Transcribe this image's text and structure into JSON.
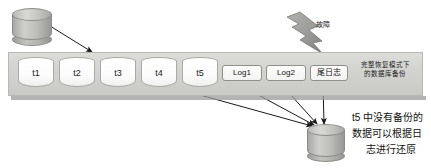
{
  "diagram": {
    "source_db": {
      "name": "source-database"
    },
    "timeline": {
      "checkpoints": [
        {
          "label": "t1"
        },
        {
          "label": "t2"
        },
        {
          "label": "t3"
        },
        {
          "label": "t4"
        },
        {
          "label": "t5"
        }
      ],
      "logs": [
        {
          "label": "Log1"
        },
        {
          "label": "Log2"
        },
        {
          "label": "尾日志"
        }
      ],
      "caption_line1": "完整恢复模式下",
      "caption_line2": "的数据库备份"
    },
    "fault": {
      "label": "故障"
    },
    "restore_db": {
      "name": "restored-database"
    },
    "restore_note": {
      "line1": "t5 中没有备份的",
      "line2": "数据可以根据日",
      "line3": "志进行还原"
    },
    "colors": {
      "bar_fill": "#d2d2ce",
      "bar_border": "#b7b7b3",
      "cylinder_fill": "#bdbdb9",
      "arrow": "#1a1a1a",
      "bolt_fill": "#9e9e9a",
      "text": "#111111"
    }
  }
}
